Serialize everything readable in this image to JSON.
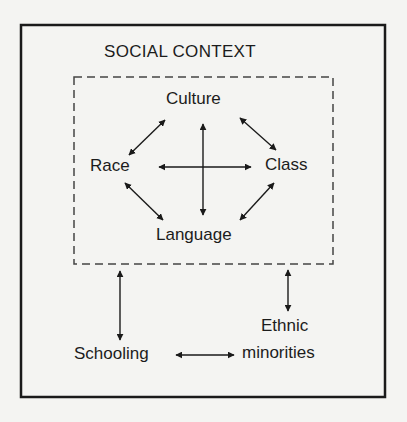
{
  "diagram": {
    "outer_box_title": "SOCIAL CONTEXT",
    "inner_group_style": "dashed",
    "nodes": {
      "culture": "Culture",
      "race": "Race",
      "class": "Class",
      "language": "Language",
      "schooling": "Schooling",
      "ethnic_line1": "Ethnic",
      "ethnic_line2": "minorities"
    },
    "edges": [
      {
        "from": "Race",
        "to": "Culture",
        "type": "bidirectional"
      },
      {
        "from": "Culture",
        "to": "Class",
        "type": "bidirectional"
      },
      {
        "from": "Race",
        "to": "Language",
        "type": "bidirectional"
      },
      {
        "from": "Class",
        "to": "Language",
        "type": "bidirectional"
      },
      {
        "from": "Race",
        "to": "Class",
        "type": "bidirectional"
      },
      {
        "from": "Culture",
        "to": "Language",
        "type": "bidirectional"
      },
      {
        "from": "Social context group",
        "to": "Schooling",
        "type": "bidirectional"
      },
      {
        "from": "Social context group",
        "to": "Ethnic minorities",
        "type": "bidirectional"
      },
      {
        "from": "Schooling",
        "to": "Ethnic minorities",
        "type": "bidirectional"
      }
    ],
    "colors": {
      "background": "#f4f4f2",
      "ink": "#1a1a1a",
      "dashed": "#444444"
    }
  }
}
